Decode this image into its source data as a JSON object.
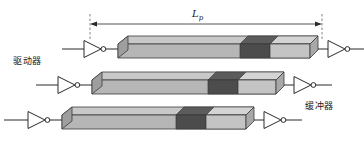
{
  "figure": {
    "title_label": "",
    "background_color": "#ffffff",
    "line_color": "#2a2a2a",
    "dimension": {
      "name": "interconnect-length",
      "symbol": "L",
      "subscript": "p",
      "label": "Lp",
      "x_start": 90,
      "x_end": 322,
      "y": 24
    },
    "labels": {
      "driver": "驱动器",
      "buffer": "缓冲器"
    },
    "palette": {
      "bar_top": "#c6c6c6",
      "bar_front": "#b4b4b4",
      "bar_dark_top": "#5c5c5c",
      "bar_dark_front": "#4a4a4a",
      "bar_light_top": "#d2d2d2",
      "bar_light_front": "#bdbdbd",
      "bar_cap": "#9a9a9a",
      "outline": "#3a3a3a",
      "wire": "#2a2a2a",
      "dash": "#555555"
    },
    "rows": [
      {
        "name": "interconnect-row-1",
        "y": 36,
        "bar_x": 118,
        "bar_w": 200,
        "segments": [
          {
            "name": "segment-light-1",
            "shade": "light",
            "width_pct": 60
          },
          {
            "name": "segment-dark-1",
            "shade": "dark",
            "width_pct": 16
          },
          {
            "name": "segment-light-2",
            "shade": "light",
            "width_pct": 24
          }
        ],
        "input_inverter": {
          "name": "driver-inverter-1",
          "x": 82,
          "y": 49
        },
        "output_inverter": {
          "name": "buffer-inverter-1",
          "x": 322,
          "y": 49
        }
      },
      {
        "name": "interconnect-row-2",
        "y": 72,
        "bar_x": 92,
        "bar_w": 192,
        "segments": [
          {
            "name": "segment-light-1",
            "shade": "light",
            "width_pct": 58
          },
          {
            "name": "segment-dark-1",
            "shade": "dark",
            "width_pct": 16
          },
          {
            "name": "segment-light-2",
            "shade": "light",
            "width_pct": 26
          }
        ],
        "input_inverter": {
          "name": "driver-inverter-2",
          "x": 56,
          "y": 85
        },
        "output_inverter": {
          "name": "buffer-inverter-2",
          "x": 288,
          "y": 85
        }
      },
      {
        "name": "interconnect-row-3",
        "y": 107,
        "bar_x": 62,
        "bar_w": 192,
        "segments": [
          {
            "name": "segment-light-1",
            "shade": "light",
            "width_pct": 57
          },
          {
            "name": "segment-dark-1",
            "shade": "dark",
            "width_pct": 16
          },
          {
            "name": "segment-light-2",
            "shade": "light",
            "width_pct": 27
          }
        ],
        "input_inverter": {
          "name": "driver-inverter-3",
          "x": 26,
          "y": 120
        },
        "output_inverter": {
          "name": "buffer-inverter-3",
          "x": 258,
          "y": 120
        }
      }
    ]
  }
}
